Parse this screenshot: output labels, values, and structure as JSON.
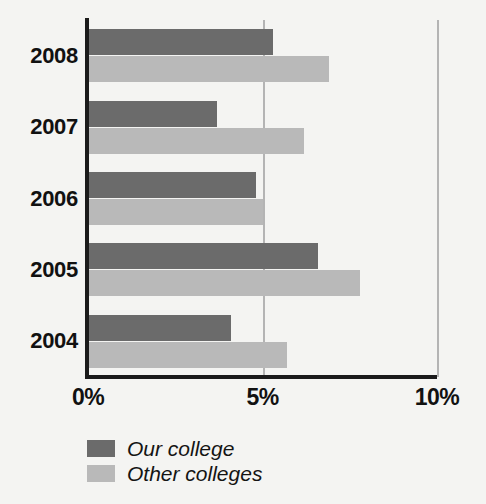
{
  "chart_data": {
    "type": "bar",
    "orientation": "horizontal",
    "title": "",
    "xlabel": "",
    "ylabel": "",
    "categories": [
      "2008",
      "2007",
      "2006",
      "2005",
      "2004"
    ],
    "series": [
      {
        "name": "Our college",
        "color": "#6b6b6b",
        "values": [
          5.3,
          3.7,
          4.8,
          6.6,
          4.1
        ]
      },
      {
        "name": "Other colleges",
        "color": "#b9b9b9",
        "values": [
          6.9,
          6.2,
          5.0,
          7.8,
          5.7
        ]
      }
    ],
    "xlim": [
      0,
      10
    ],
    "xticks": [
      0,
      5,
      10
    ],
    "xtick_labels": [
      "0%",
      "5%",
      "10%"
    ],
    "grid": "vertical-at-xticks",
    "legend_position": "bottom-left"
  },
  "legend": {
    "items": [
      {
        "label": "Our college",
        "swatch_name": "legend-swatch-our-college"
      },
      {
        "label": "Other colleges",
        "swatch_name": "legend-swatch-other-colleges"
      }
    ]
  },
  "colors": {
    "background": "#f4f4f2",
    "axis": "#1b1b1b",
    "gridline": "#b4b4b4",
    "series_ours": "#6b6b6b",
    "series_others": "#b9b9b9",
    "text": "#111111"
  }
}
